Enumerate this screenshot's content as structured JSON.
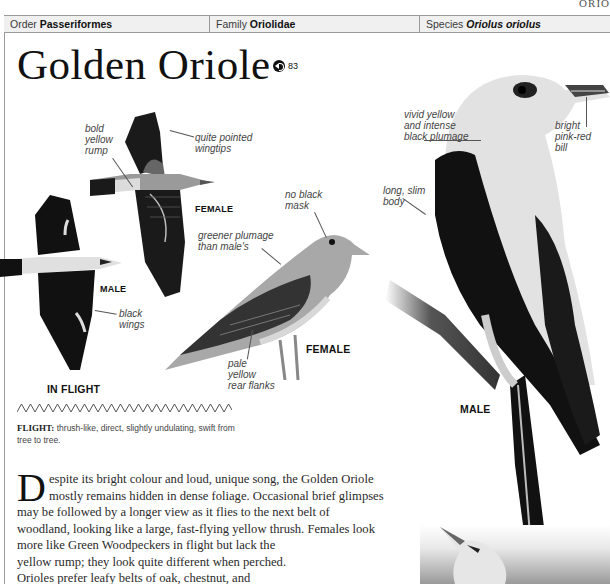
{
  "section_tag": "ORIO",
  "header": {
    "order": {
      "label": "Order",
      "value": "Passeriformes"
    },
    "family": {
      "label": "Family",
      "value": "Oriolidae"
    },
    "species": {
      "label": "Species",
      "value": "Oriolus oriolus"
    }
  },
  "title": "Golden Oriole",
  "sound": {
    "icon": "speaker-icon",
    "track_number": "83"
  },
  "illustrations": {
    "flight_female": {
      "label": "FEMALE",
      "annotations": [
        "bold yellow rump",
        "quite pointed wingtips"
      ]
    },
    "flight_male": {
      "label": "MALE",
      "annotations": [
        "black wings"
      ]
    },
    "flight_caption": "IN FLIGHT",
    "perched_female": {
      "label": "FEMALE",
      "annotations": [
        "no black mask",
        "greener plumage than male's",
        "pale yellow rear flanks"
      ]
    },
    "perched_male": {
      "label": "MALE",
      "annotations": [
        "vivid yellow and intense black plumage",
        "long, slim body",
        "bright pink-red bill"
      ]
    }
  },
  "annotation_lines": {
    "bold_yellow_rump": [
      "bold",
      "yellow",
      "rump"
    ],
    "quite_pointed": [
      "quite pointed",
      "wingtips"
    ],
    "black_wings": [
      "black",
      "wings"
    ],
    "no_black_mask": [
      "no black",
      "mask"
    ],
    "greener": [
      "greener plumage",
      "than male's"
    ],
    "pale_yellow": [
      "pale",
      "yellow",
      "rear flanks"
    ],
    "vivid": [
      "vivid yellow",
      "and intense",
      "black plumage"
    ],
    "long_slim": [
      "long, slim",
      "body"
    ],
    "bright_bill": [
      "bright",
      "pink-red",
      "bill"
    ]
  },
  "flight": {
    "heading": "FLIGHT:",
    "text": "thrush-like, direct, slightly undulating, swift from tree to tree."
  },
  "description": {
    "dropcap": "D",
    "lines": [
      "espite its bright colour and loud, unique song, the Golden Oriole",
      "mostly remains hidden in dense foliage. Occasional brief glimpses",
      "may be followed by a longer view as it flies to the next belt of",
      "woodland, looking like a large, fast-flying yellow thrush. Females look",
      "more like Green Woodpeckers in flight but lack the",
      "yellow rump; they look quite different when perched.",
      "Orioles prefer leafy belts of oak, chestnut, and"
    ]
  }
}
